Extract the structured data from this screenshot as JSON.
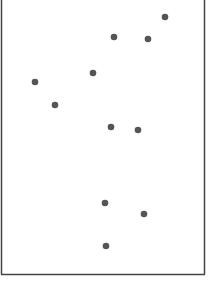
{
  "chart_data": {
    "type": "scatter",
    "title": "",
    "xlabel": "",
    "ylabel": "",
    "grid": false,
    "legend": null,
    "axes_visible": false,
    "marker_color": "#555555",
    "frame_color": "#444444",
    "points_px": [
      {
        "x": 165,
        "y": 17
      },
      {
        "x": 114,
        "y": 37
      },
      {
        "x": 148,
        "y": 39
      },
      {
        "x": 93,
        "y": 73
      },
      {
        "x": 35,
        "y": 82
      },
      {
        "x": 55,
        "y": 105
      },
      {
        "x": 111,
        "y": 127
      },
      {
        "x": 138,
        "y": 130
      },
      {
        "x": 105,
        "y": 203
      },
      {
        "x": 144,
        "y": 214
      },
      {
        "x": 106,
        "y": 246
      }
    ]
  }
}
